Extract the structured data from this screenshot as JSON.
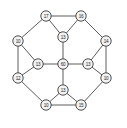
{
  "figure": {
    "title": "",
    "background_color": "#ffffff",
    "width": 127,
    "height": 128
  },
  "chart_data": {
    "type": "diagram",
    "diagram_kind": "node-link-graph",
    "title": "",
    "node_style": {
      "shape": "circle",
      "fill": "#f2f2f2",
      "stroke": "#3c3c3c",
      "radius": 5.2,
      "label_font_size": 4.6
    },
    "edge_style": {
      "stroke": "#4a4a4a",
      "stroke_width": 0.9,
      "directed": false
    },
    "nodes": [
      {
        "id": "n0",
        "label": "17",
        "x": 46,
        "y": 16,
        "role": "outer"
      },
      {
        "id": "n1",
        "label": "16",
        "x": 81,
        "y": 16,
        "role": "outer"
      },
      {
        "id": "n2",
        "label": "14",
        "x": 106,
        "y": 41,
        "role": "outer"
      },
      {
        "id": "n3",
        "label": "10",
        "x": 106,
        "y": 78,
        "role": "outer"
      },
      {
        "id": "n4",
        "label": "15",
        "x": 81,
        "y": 105,
        "role": "outer"
      },
      {
        "id": "n5",
        "label": "10",
        "x": 46,
        "y": 105,
        "role": "outer"
      },
      {
        "id": "n6",
        "label": "12",
        "x": 18,
        "y": 78,
        "role": "outer"
      },
      {
        "id": "n7",
        "label": "10",
        "x": 18,
        "y": 41,
        "role": "outer"
      },
      {
        "id": "n8",
        "label": "13",
        "x": 63,
        "y": 37,
        "role": "intermediate"
      },
      {
        "id": "n9",
        "label": "13",
        "x": 88,
        "y": 64,
        "role": "intermediate"
      },
      {
        "id": "n10",
        "label": "13",
        "x": 63,
        "y": 90,
        "role": "intermediate"
      },
      {
        "id": "n11",
        "label": "13",
        "x": 38,
        "y": 64,
        "role": "intermediate"
      },
      {
        "id": "n12",
        "label": "60",
        "x": 63,
        "y": 64,
        "role": "center"
      }
    ],
    "edges": [
      {
        "source": "n0",
        "target": "n1"
      },
      {
        "source": "n1",
        "target": "n2"
      },
      {
        "source": "n2",
        "target": "n3"
      },
      {
        "source": "n3",
        "target": "n4"
      },
      {
        "source": "n4",
        "target": "n5"
      },
      {
        "source": "n5",
        "target": "n6"
      },
      {
        "source": "n6",
        "target": "n7"
      },
      {
        "source": "n7",
        "target": "n0"
      },
      {
        "source": "n0",
        "target": "n8"
      },
      {
        "source": "n1",
        "target": "n8"
      },
      {
        "source": "n2",
        "target": "n9"
      },
      {
        "source": "n3",
        "target": "n9"
      },
      {
        "source": "n4",
        "target": "n10"
      },
      {
        "source": "n5",
        "target": "n10"
      },
      {
        "source": "n6",
        "target": "n11"
      },
      {
        "source": "n7",
        "target": "n11"
      },
      {
        "source": "n8",
        "target": "n12"
      },
      {
        "source": "n9",
        "target": "n12"
      },
      {
        "source": "n10",
        "target": "n12"
      },
      {
        "source": "n11",
        "target": "n12"
      }
    ]
  }
}
